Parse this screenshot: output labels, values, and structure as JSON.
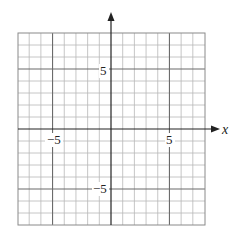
{
  "chart_data": {
    "type": "coordinate-grid",
    "title": "",
    "xlabel": "x",
    "ylabel": "",
    "xlim": [
      -8,
      8
    ],
    "ylim": [
      -8,
      8
    ],
    "grid": true,
    "grid_step": 1,
    "major_lines": [
      -5,
      5
    ],
    "tick_labels": {
      "x": [
        {
          "value": -5,
          "label": "−5"
        },
        {
          "value": 5,
          "label": "5"
        }
      ],
      "y": [
        {
          "value": 5,
          "label": "5"
        },
        {
          "value": -5,
          "label": "−5"
        }
      ]
    },
    "series": []
  },
  "labels": {
    "x_axis": "x",
    "x_neg5": "−5",
    "x_pos5": "5",
    "y_pos5": "5",
    "y_neg5": "−5"
  },
  "colors": {
    "grid": "#b8b8b8",
    "major": "#6a6a6a",
    "axis": "#222222"
  }
}
